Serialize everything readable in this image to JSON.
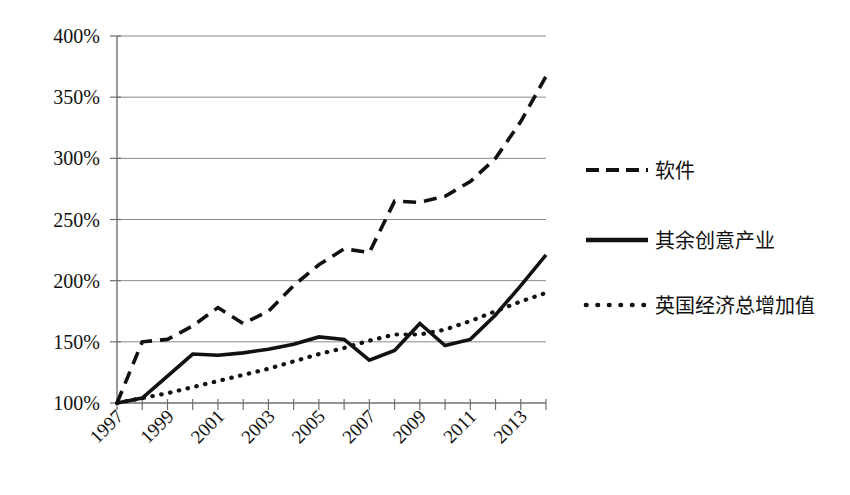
{
  "chart_data": {
    "type": "line",
    "title": "",
    "subtitle": "",
    "xlabel": "",
    "ylabel": "",
    "grid": true,
    "legend_position": "right",
    "x": [
      1997,
      1998,
      1999,
      2000,
      2001,
      2002,
      2003,
      2004,
      2005,
      2006,
      2007,
      2008,
      2009,
      2010,
      2011,
      2012,
      2013,
      2014
    ],
    "xlim": [
      1997,
      2014
    ],
    "ylim": [
      100,
      400
    ],
    "yticks": [
      100,
      150,
      200,
      250,
      300,
      350,
      400
    ],
    "ytick_labels": [
      "100%",
      "150%",
      "200%",
      "250%",
      "300%",
      "350%",
      "400%"
    ],
    "xtick_labels": [
      "1997",
      "1999",
      "2001",
      "2003",
      "2005",
      "2007",
      "2009",
      "2011",
      "2013"
    ],
    "xticks_shown": [
      1997,
      1999,
      2001,
      2003,
      2005,
      2007,
      2009,
      2011,
      2013
    ],
    "series": [
      {
        "name": "软件",
        "style": "dashed",
        "color": "#111111",
        "values": [
          100,
          150,
          152,
          163,
          178,
          165,
          175,
          196,
          213,
          226,
          223,
          265,
          264,
          269,
          281,
          300,
          330,
          367
        ]
      },
      {
        "name": "其余创意产业",
        "style": "solid",
        "color": "#111111",
        "values": [
          100,
          104,
          122,
          140,
          139,
          141,
          144,
          148,
          154,
          152,
          135,
          143,
          165,
          147,
          152,
          172,
          196,
          221
        ]
      },
      {
        "name": "英国经济总增加值",
        "style": "dotted",
        "color": "#111111",
        "values": [
          100,
          104,
          108,
          113,
          118,
          123,
          128,
          134,
          140,
          145,
          151,
          156,
          156,
          160,
          167,
          175,
          183,
          190
        ]
      }
    ]
  },
  "legend": {
    "items": [
      {
        "label": "软件",
        "style": "dashed"
      },
      {
        "label": "其余创意产业",
        "style": "solid"
      },
      {
        "label": "英国经济总增加值",
        "style": "dotted"
      }
    ]
  },
  "axes": {
    "y_labels": [
      "400%",
      "350%",
      "300%",
      "250%",
      "200%",
      "150%",
      "100%"
    ],
    "x_labels": [
      "1997",
      "1999",
      "2001",
      "2003",
      "2005",
      "2007",
      "2009",
      "2011",
      "2013"
    ]
  }
}
